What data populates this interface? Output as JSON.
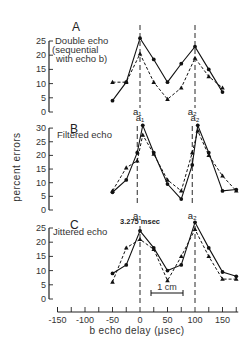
{
  "chart_data": {
    "type": "line",
    "xlabel": "b echo delay (μsec)",
    "ylabel": "percent errors",
    "xlim": [
      -150,
      175
    ],
    "xticks": [
      -150,
      -125,
      -100,
      -75,
      -50,
      -25,
      0,
      25,
      50,
      75,
      100,
      125,
      150,
      175
    ],
    "xticklabels": [
      "-150",
      "-100",
      "-50",
      "0",
      "50",
      "100",
      "150"
    ],
    "xticklabel_values": [
      -150,
      -100,
      -50,
      0,
      50,
      100,
      150
    ],
    "grid": false,
    "legend": null,
    "panels": [
      {
        "letter": "A",
        "title_lines": [
          "Double echo",
          "(sequential",
          "with echo b)"
        ],
        "ylim": [
          0,
          25
        ],
        "yticks": [
          0,
          5,
          10,
          15,
          20,
          25
        ],
        "markers": [
          {
            "label": "a1",
            "x": 0
          },
          {
            "label": "a2",
            "x": 100
          }
        ],
        "series": [
          {
            "name": "circles (solid line)",
            "marker": "circle",
            "line": "solid",
            "x": [
              -50,
              -25,
              0,
              25,
              50,
              75,
              100,
              125,
              150
            ],
            "y": [
              4,
              10.5,
              26,
              18.5,
              10.5,
              17,
              23,
              15,
              7
            ]
          },
          {
            "name": "triangles (dashed line)",
            "marker": "triangle",
            "line": "dashed",
            "x": [
              -50,
              -25,
              0,
              25,
              50,
              75,
              100,
              125,
              150
            ],
            "y": [
              10.5,
              10.5,
              20.5,
              10.5,
              4.5,
              8.5,
              19,
              12.5,
              8.5
            ]
          }
        ]
      },
      {
        "letter": "B",
        "title_lines": [
          "Filtered echo"
        ],
        "ylim": [
          0,
          30
        ],
        "yticks": [
          0,
          5,
          10,
          15,
          20,
          25,
          30
        ],
        "markers": [
          {
            "label": "a1",
            "x": -5
          },
          {
            "label": "a2",
            "x": 95
          }
        ],
        "series": [
          {
            "name": "circles (solid line)",
            "marker": "circle",
            "line": "solid",
            "x": [
              -50,
              -25,
              -5,
              5,
              25,
              50,
              75,
              95,
              105,
              125,
              150,
              175
            ],
            "y": [
              6.5,
              11,
              21,
              31,
              21,
              9.5,
              4,
              16.5,
              31,
              21,
              7,
              7.5
            ]
          },
          {
            "name": "triangles (dashed line)",
            "marker": "triangle",
            "line": "dashed",
            "x": [
              -50,
              -25,
              -5,
              5,
              25,
              50,
              75,
              95,
              105,
              125,
              150,
              175
            ],
            "y": [
              7,
              15.5,
              18,
              27.5,
              20.5,
              11,
              7,
              21,
              29,
              20,
              12.5,
              7
            ]
          }
        ]
      },
      {
        "letter": "C",
        "title_lines": [
          "Jittered echo"
        ],
        "note": "3.275 msec",
        "scalebar": "1 cm",
        "ylim": [
          0,
          25
        ],
        "yticks": [
          0,
          5,
          10,
          15,
          20,
          25
        ],
        "markers": [
          {
            "label": "",
            "x": 0
          },
          {
            "label": "",
            "x": 100
          }
        ],
        "series": [
          {
            "name": "circles (solid line)",
            "marker": "circle",
            "line": "solid",
            "x": [
              -50,
              -25,
              0,
              25,
              50,
              75,
              100,
              125,
              150,
              175
            ],
            "y": [
              9,
              12,
              24,
              18,
              10,
              12,
              27,
              18,
              9.5,
              8
            ]
          },
          {
            "name": "triangles (dashed line)",
            "marker": "triangle",
            "line": "dashed",
            "x": [
              -50,
              -25,
              0,
              25,
              50,
              75,
              100,
              125,
              150,
              175
            ],
            "y": [
              6,
              18,
              21,
              17.5,
              6.5,
              15,
              24.5,
              15,
              7,
              7
            ]
          }
        ]
      }
    ]
  },
  "labels": {
    "a1": "a₁",
    "a2": "a₂"
  }
}
